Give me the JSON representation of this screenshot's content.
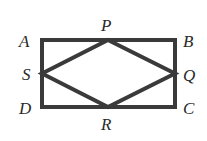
{
  "diagram": {
    "type": "geometry",
    "stroke_color": "#3a3a3a",
    "labels": {
      "A": "A",
      "B": "B",
      "C": "C",
      "D": "D",
      "P": "P",
      "Q": "Q",
      "R": "R",
      "S": "S"
    },
    "rectangle": [
      "A",
      "B",
      "C",
      "D"
    ],
    "rhombus": [
      "P",
      "Q",
      "R",
      "S"
    ],
    "midpoints": {
      "P": "midpoint of AB",
      "Q": "midpoint of BC",
      "R": "midpoint of CD",
      "S": "midpoint of DA"
    }
  }
}
